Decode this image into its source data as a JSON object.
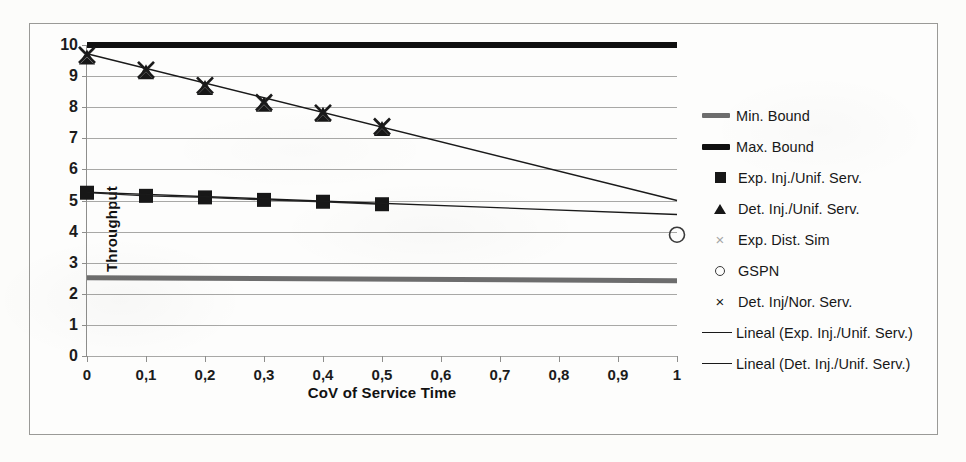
{
  "chart_data": {
    "type": "line",
    "title": "",
    "xlabel": "CoV of Service Time",
    "ylabel": "Throughput",
    "xlim": [
      0,
      1
    ],
    "ylim": [
      0,
      10
    ],
    "xticks": [
      "0",
      "0,1",
      "0,2",
      "0,3",
      "0,4",
      "0,5",
      "0,6",
      "0,7",
      "0,8",
      "0,9",
      "1"
    ],
    "xtick_values": [
      0,
      0.1,
      0.2,
      0.3,
      0.4,
      0.5,
      0.6,
      0.7,
      0.8,
      0.9,
      1
    ],
    "yticks": [
      "0",
      "1",
      "2",
      "3",
      "4",
      "5",
      "6",
      "7",
      "8",
      "9",
      "10"
    ],
    "ytick_values": [
      0,
      1,
      2,
      3,
      4,
      5,
      6,
      7,
      8,
      9,
      10
    ],
    "grid": "horizontal",
    "legend_position": "right",
    "series": [
      {
        "name": "Min. Bound",
        "style": "thick-gray-line",
        "color": "#6d6d6d",
        "x": [
          0,
          1
        ],
        "values": [
          2.52,
          2.42
        ]
      },
      {
        "name": "Max. Bound",
        "style": "thick-black-line",
        "color": "#101010",
        "x": [
          0,
          1
        ],
        "values": [
          10.0,
          10.0
        ]
      },
      {
        "name": "Exp. Inj./Unif. Serv.",
        "style": "square-markers",
        "color": "#171717",
        "x": [
          0,
          0.1,
          0.2,
          0.3,
          0.4,
          0.5
        ],
        "values": [
          5.25,
          5.15,
          5.1,
          5.02,
          4.96,
          4.88
        ]
      },
      {
        "name": "Det. Inj./Unif. Serv.",
        "style": "triangle-markers",
        "color": "#171717",
        "x": [
          0,
          0.1,
          0.2,
          0.3,
          0.4,
          0.5
        ],
        "values": [
          9.6,
          9.12,
          8.62,
          8.08,
          7.76,
          7.3
        ]
      },
      {
        "name": "Exp. Dist. Sim",
        "style": "x-markers-faded",
        "color": "#a6a6a6",
        "x": [
          0,
          0.1,
          0.2,
          0.3,
          0.4,
          0.5
        ],
        "values": [
          9.65,
          9.18,
          8.68,
          8.12,
          7.8,
          7.35
        ]
      },
      {
        "name": "GSPN",
        "style": "circle-marker",
        "color": "#3a3a3a",
        "x": [
          1
        ],
        "values": [
          3.9
        ]
      },
      {
        "name": "Det. Inj/Nor. Serv.",
        "style": "x-markers",
        "color": "#1a1a1a",
        "x": [
          0,
          0.1,
          0.2,
          0.3,
          0.4,
          0.5
        ],
        "values": [
          9.68,
          9.2,
          8.7,
          8.15,
          7.82,
          7.38
        ]
      },
      {
        "name": "Lineal (Exp. Inj./Unif. Serv.)",
        "style": "thin-trend-line",
        "color": "#1a1a1a",
        "x": [
          0,
          1
        ],
        "values": [
          5.27,
          4.55
        ]
      },
      {
        "name": "Lineal (Det. Inj./Unif. Serv.)",
        "style": "thin-trend-line",
        "color": "#1a1a1a",
        "x": [
          0,
          1
        ],
        "values": [
          9.72,
          5.0
        ]
      }
    ]
  },
  "axes": {
    "y_title": "Throughput",
    "x_title": "CoV of Service Time"
  },
  "legend": {
    "items": [
      {
        "label": "Min. Bound",
        "key": "thick-gray-line-icon"
      },
      {
        "label": "Max. Bound",
        "key": "thick-black-line-icon"
      },
      {
        "label": "Exp. Inj./Unif. Serv.",
        "key": "filled-square-icon"
      },
      {
        "label": "Det. Inj./Unif. Serv.",
        "key": "filled-triangle-icon"
      },
      {
        "label": "Exp. Dist. Sim",
        "key": "x-mark-faded-icon"
      },
      {
        "label": "GSPN",
        "key": "open-circle-icon"
      },
      {
        "label": "Det. Inj/Nor. Serv.",
        "key": "x-mark-icon"
      },
      {
        "label": "Lineal (Exp. Inj./Unif. Serv.)",
        "key": "thin-line-icon"
      },
      {
        "label": "Lineal (Det. Inj./Unif. Serv.)",
        "key": "thin-line-icon"
      }
    ]
  },
  "colors": {
    "grid": "#a8a8a6",
    "axis": "#8e8e8c",
    "frame": "#9a9a97",
    "background": "#fdfdfc",
    "marker_dark": "#171717",
    "marker_faded": "#a6a6a6",
    "min_bound": "#6d6d6d",
    "max_bound": "#101010"
  }
}
